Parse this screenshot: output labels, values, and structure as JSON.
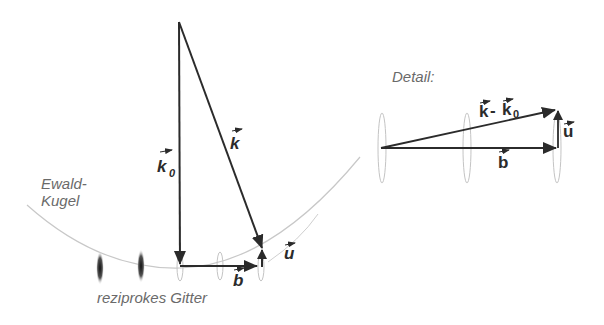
{
  "labels": {
    "ewald_line1": "Ewald-",
    "ewald_line2": "Kugel",
    "reciprocal_lattice": "reziprokes Gitter",
    "detail": "Detail:",
    "vec_k": "k",
    "vec_k0": "k",
    "vec_k0_sub": "0",
    "vec_b": "b",
    "vec_u": "u",
    "detail_vec_diff_k": "k",
    "detail_vec_diff_sep": " - ",
    "detail_vec_diff_k0": "k",
    "detail_vec_diff_k0_sub": "0",
    "detail_vec_b": "b",
    "detail_vec_u": "u"
  },
  "colors": {
    "arrow": "#2b2b2b",
    "arc": "#c8c8c8",
    "label_gray": "#6a6a6a",
    "lattice_dark": "#333333",
    "lattice_light": "#b8b8b8"
  }
}
